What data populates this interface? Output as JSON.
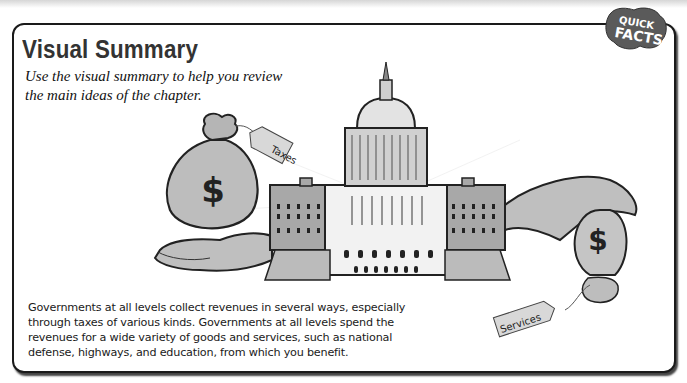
{
  "header": {
    "title": "Visual Summary",
    "subtitle": "Use the visual summary to help you review the main ideas of the chapter."
  },
  "badge": {
    "line1": "QUICK",
    "line2": "FACTS"
  },
  "illustration": {
    "taxes_tag": "Taxes",
    "services_tag": "Services",
    "money_symbol": "$"
  },
  "summary": {
    "text": "Governments at all levels collect revenues in several ways, especially through taxes of various kinds. Governments at all levels spend the revenues for a wide variety of goods and services, such as national defense, highways, and education, from which you benefit."
  },
  "colors": {
    "border": "#1a1a1a",
    "title": "#333333",
    "badge_fill": "#5a5a5a",
    "illustration_fill": "#b8b8b8"
  }
}
